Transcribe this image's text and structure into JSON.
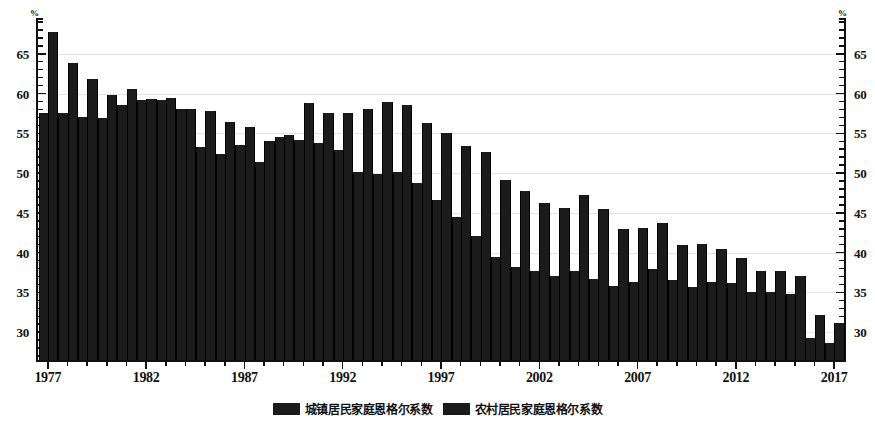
{
  "chart_data": {
    "type": "bar",
    "title": "",
    "subtitle": "",
    "xlabel": "",
    "ylabel": "%",
    "ylabel_right": "%",
    "ylim": [
      26.5,
      69.5
    ],
    "yticks": [
      30,
      35,
      40,
      45,
      50,
      55,
      60,
      65
    ],
    "ytick_labels": [
      "30",
      "35",
      "40",
      "45",
      "50",
      "55",
      "60",
      "65"
    ],
    "y_minor_step": 1,
    "grid": true,
    "grid_axis": "y",
    "legend_position": "bottom",
    "bar_color": "#1b1b1b",
    "x": [
      1977,
      1978,
      1979,
      1980,
      1981,
      1982,
      1983,
      1984,
      1985,
      1986,
      1987,
      1988,
      1989,
      1990,
      1991,
      1992,
      1993,
      1994,
      1995,
      1996,
      1997,
      1998,
      1999,
      2000,
      2001,
      2002,
      2003,
      2004,
      2005,
      2006,
      2007,
      2008,
      2009,
      2010,
      2011,
      2012,
      2013,
      2014,
      2015,
      2016,
      2017
    ],
    "xticks": [
      1977,
      1982,
      1987,
      1992,
      1997,
      2002,
      2007,
      2012,
      2017
    ],
    "xtick_labels": [
      "1977",
      "1982",
      "1987",
      "1992",
      "1997",
      "2002",
      "2007",
      "2012",
      "2017"
    ],
    "categories": [
      "1977",
      "1978",
      "1979",
      "1980",
      "1981",
      "1982",
      "1983",
      "1984",
      "1985",
      "1986",
      "1987",
      "1988",
      "1989",
      "1990",
      "1991",
      "1992",
      "1993",
      "1994",
      "1995",
      "1996",
      "1997",
      "1998",
      "1999",
      "2000",
      "2001",
      "2002",
      "2003",
      "2004",
      "2005",
      "2006",
      "2007",
      "2008",
      "2009",
      "2010",
      "2011",
      "2012",
      "2013",
      "2014",
      "2015",
      "2016",
      "2017"
    ],
    "series": [
      {
        "name": "城镇居民家庭恩格尔系数",
        "color": "#1b1b1b",
        "values": [
          57.5,
          57.5,
          57.0,
          56.9,
          58.6,
          59.2,
          59.2,
          58.0,
          53.3,
          52.4,
          53.5,
          51.4,
          54.5,
          54.2,
          53.8,
          52.9,
          50.1,
          49.9,
          50.1,
          48.8,
          46.6,
          44.5,
          42.1,
          39.4,
          38.2,
          37.7,
          37.1,
          37.7,
          36.7,
          35.8,
          36.3,
          37.9,
          36.5,
          35.7,
          36.3,
          36.2,
          35.0,
          35.0,
          34.8,
          29.3,
          28.6
        ],
        "label_en": "Urban household Engel coefficient"
      },
      {
        "name": "农村居民家庭恩格尔系数",
        "color": "#1b1b1b",
        "values": [
          67.7,
          63.9,
          61.8,
          59.8,
          60.6,
          59.3,
          59.4,
          58.0,
          57.8,
          56.4,
          55.8,
          54.0,
          54.8,
          58.8,
          57.6,
          57.6,
          58.1,
          58.9,
          58.6,
          56.3,
          55.1,
          53.4,
          52.6,
          49.1,
          47.7,
          46.2,
          45.6,
          47.2,
          45.5,
          43.0,
          43.1,
          43.7,
          41.0,
          41.1,
          40.4,
          39.3,
          37.7,
          37.7,
          37.1,
          32.2,
          31.2
        ],
        "label_en": "Rural household Engel coefficient"
      }
    ]
  },
  "legend": {
    "items": [
      {
        "label": "城镇居民家庭恩格尔系数"
      },
      {
        "label": "农村居民家庭恩格尔系数"
      }
    ]
  },
  "axes": {
    "unit_left": "%",
    "unit_right": "%"
  }
}
